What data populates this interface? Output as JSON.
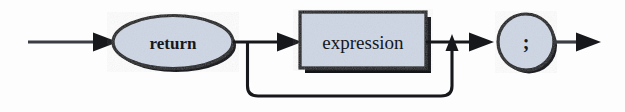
{
  "diagram": {
    "kind": "railroad-syntax-diagram",
    "background_color": "#fdfdfd",
    "line_color": "#17181c",
    "shape_fill_color": "#ced6e4",
    "shape_stroke_color": "#17181c",
    "shadow_color": "#141519",
    "text_color": "#15171c",
    "entry": {
      "name": "entry-arrow",
      "label": ""
    },
    "exit": {
      "name": "exit-arrow",
      "label": ""
    },
    "nodes": [
      {
        "id": "return-keyword",
        "shape": "ellipse",
        "type": "terminal",
        "label": "return"
      },
      {
        "id": "expression",
        "shape": "rectangle",
        "type": "nonterminal",
        "label": "expression"
      },
      {
        "id": "semicolon",
        "shape": "circle",
        "type": "terminal",
        "label": ";"
      }
    ],
    "paths": [
      {
        "id": "main-path",
        "label": "return → expression → ;"
      },
      {
        "id": "bypass-path",
        "label": "optional expression bypass loop"
      }
    ]
  }
}
